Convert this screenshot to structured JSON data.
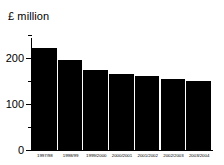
{
  "chart_data": {
    "type": "bar",
    "title": "",
    "ylabel": "£ million",
    "xlabel": "",
    "categories": [
      "1997/98",
      "1998/99",
      "1999/2000",
      "2000/2001",
      "2001/2002",
      "2002/2003",
      "2003/2004"
    ],
    "values": [
      222,
      196,
      174,
      165,
      161,
      154,
      150
    ],
    "ylim": [
      0,
      250
    ],
    "y_major_ticks": [
      0,
      100,
      200
    ],
    "y_major_tick_labels": [
      "0",
      "100",
      "200"
    ],
    "y_minor_ticks": [
      50,
      150,
      250
    ],
    "grid": false,
    "legend": null,
    "bar_color": "#000000",
    "background_color": "#ffffff",
    "axis_color": "#000000"
  }
}
